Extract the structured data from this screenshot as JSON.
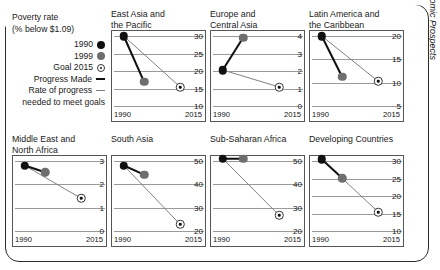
{
  "legend": {
    "title_line1": "Poverty rate",
    "title_line2": "(% below $1.09)",
    "items": [
      {
        "label": "1990",
        "marker": "black-dot-icon"
      },
      {
        "label": "1999",
        "marker": "gray-dot-icon"
      },
      {
        "label": "Goal 2015",
        "marker": "target-dot-icon"
      },
      {
        "label": "Progress Made",
        "marker": "thick-black-dash-icon"
      },
      {
        "label": "Rate of progress",
        "marker": "thin-gray-dash-icon"
      }
    ],
    "footnote": "needed to meet goals"
  },
  "source": "Source: Global Economic Prospects",
  "colors": {
    "year1990": "#111111",
    "year1999": "#6e6e6e",
    "goal2015": "#ffffff",
    "progress_line": "#111111",
    "required_line": "#7d7d7d",
    "gridline": "#9a9a9a",
    "border": "#2b2b2b"
  },
  "chart_data": {
    "type": "line",
    "title": "Poverty rate (% below $1.09)",
    "xlabel": "",
    "ylabel": "",
    "grid": true,
    "legend_position": "top-left",
    "x": [
      "1990",
      "2015"
    ],
    "series_names": [
      "1990",
      "1999",
      "Goal 2015"
    ],
    "panels": [
      {
        "name": "East Asia and the Pacific",
        "title_line1": "East Asia and",
        "title_line2": "the Pacific",
        "ylim": [
          10,
          30
        ],
        "yticks": [
          10,
          15,
          20,
          25,
          30
        ],
        "xticks": [
          "1990",
          "2015"
        ],
        "value_1990": 30.0,
        "value_1999": 16.5,
        "value_goal2015": 15.0
      },
      {
        "name": "Europe and Central Asia",
        "title_line1": "Europe and",
        "title_line2": "Central Asia",
        "ylim": [
          0,
          4
        ],
        "yticks": [
          0,
          1,
          2,
          3,
          4
        ],
        "xticks": [
          "1990",
          "2015"
        ],
        "value_1990": 2.0,
        "value_1999": 3.9,
        "value_goal2015": 1.0
      },
      {
        "name": "Latin America and the Caribbean",
        "title_line1": "Latin America and",
        "title_line2": "the Caribbean",
        "ylim": [
          5,
          20
        ],
        "yticks": [
          5,
          10,
          15,
          20
        ],
        "xticks": [
          "1990",
          "2015"
        ],
        "value_1990": 20.0,
        "value_1999": 11.0,
        "value_goal2015": 10.0
      },
      {
        "name": "Middle East and North Africa",
        "title_line1": "Middle East and",
        "title_line2": "North Africa",
        "ylim": [
          0,
          3
        ],
        "yticks": [
          0,
          1,
          2,
          3
        ],
        "xticks": [
          "1990",
          "2015"
        ],
        "value_1990": 2.8,
        "value_1999": 2.5,
        "value_goal2015": 1.35
      },
      {
        "name": "South Asia",
        "title_line1": "South Asia",
        "title_line2": "",
        "ylim": [
          20,
          50
        ],
        "yticks": [
          20,
          30,
          40,
          50
        ],
        "xticks": [
          "1990",
          "2015"
        ],
        "value_1990": 48.0,
        "value_1999": 44.0,
        "value_goal2015": 22.0
      },
      {
        "name": "Sub-Saharan Africa",
        "title_line1": "Sub-Saharan Africa",
        "title_line2": "",
        "ylim": [
          20,
          50
        ],
        "yticks": [
          20,
          30,
          40,
          50
        ],
        "xticks": [
          "1990",
          "2015"
        ],
        "value_1990": 51.0,
        "value_1999": 51.0,
        "value_goal2015": 26.0
      },
      {
        "name": "Developing Countries",
        "title_line1": "Developing Countries",
        "title_line2": "",
        "ylim": [
          10,
          30
        ],
        "yticks": [
          10,
          15,
          20,
          25,
          30
        ],
        "xticks": [
          "1990",
          "2015"
        ],
        "value_1990": 30.5,
        "value_1999": 25.0,
        "value_goal2015": 15.0
      }
    ]
  }
}
